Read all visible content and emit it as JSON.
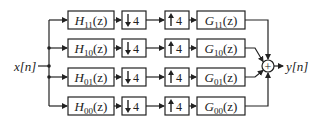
{
  "diagram": {
    "type": "block-diagram",
    "input_label": "x[n]",
    "output_label": "y[n]",
    "sum_symbol": "+",
    "colors": {
      "stroke": "#222222",
      "background": "#ffffff"
    },
    "channels": [
      {
        "analysis": {
          "name": "H",
          "sub": "11",
          "arg": "(z)"
        },
        "down": "4",
        "up": "4",
        "synthesis": {
          "name": "G",
          "sub": "11",
          "arg": "(z)"
        }
      },
      {
        "analysis": {
          "name": "H",
          "sub": "10",
          "arg": "(z)"
        },
        "down": "4",
        "up": "4",
        "synthesis": {
          "name": "G",
          "sub": "10",
          "arg": "(z)"
        }
      },
      {
        "analysis": {
          "name": "H",
          "sub": "01",
          "arg": "(z)"
        },
        "down": "4",
        "up": "4",
        "synthesis": {
          "name": "G",
          "sub": "01",
          "arg": "(z)"
        }
      },
      {
        "analysis": {
          "name": "H",
          "sub": "00",
          "arg": "(z)"
        },
        "down": "4",
        "up": "4",
        "synthesis": {
          "name": "G",
          "sub": "00",
          "arg": "(z)"
        }
      }
    ],
    "downsampler_icon": "down-arrow-icon",
    "upsampler_icon": "up-arrow-icon"
  }
}
